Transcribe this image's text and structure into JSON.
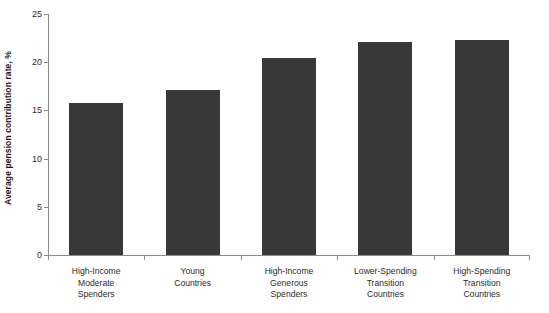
{
  "chart_data": {
    "type": "bar",
    "title": "",
    "subtitle": "",
    "xlabel": "",
    "ylabel": "Average pension contribution rate, %",
    "ylim": [
      0,
      25
    ],
    "yticks": [
      0,
      5,
      10,
      15,
      20,
      25
    ],
    "ytick_labels": [
      "0",
      "5",
      "10",
      "15",
      "20",
      "25"
    ],
    "grid": false,
    "legend": false,
    "legend_position": "none",
    "bar_color": "#383838",
    "axis_color": "#8c8c8c",
    "categories": [
      "High-Income Moderate Spenders",
      "Young Countries",
      "High-Income Generous Spenders",
      "Lower-Spending Transition Countries",
      "High-Spending Transition Countries"
    ],
    "category_lines": [
      [
        "High-Income",
        "Moderate",
        "Spenders"
      ],
      [
        "Young",
        "Countries"
      ],
      [
        "High-Income",
        "Generous",
        "Spenders"
      ],
      [
        "Lower-Spending",
        "Transition",
        "Countries"
      ],
      [
        "High-Spending",
        "Transition",
        "Countries"
      ]
    ],
    "values": [
      15.8,
      17.1,
      20.4,
      22.1,
      22.3
    ]
  }
}
